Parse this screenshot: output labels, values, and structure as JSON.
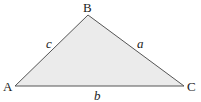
{
  "diagram": {
    "type": "triangle",
    "fill_color": "#ebebeb",
    "stroke_color": "#555555",
    "vertices": [
      {
        "label": "A",
        "x": 15,
        "y": 86
      },
      {
        "label": "B",
        "x": 88,
        "y": 15
      },
      {
        "label": "C",
        "x": 184,
        "y": 86
      }
    ],
    "sides": [
      {
        "label": "c",
        "between": "A-B"
      },
      {
        "label": "a",
        "between": "B-C"
      },
      {
        "label": "b",
        "between": "A-C"
      }
    ]
  }
}
